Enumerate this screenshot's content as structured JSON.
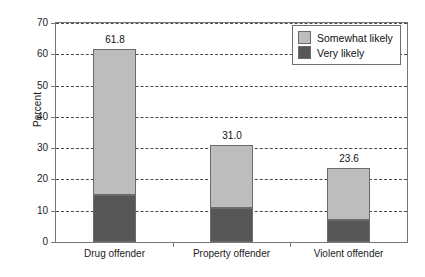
{
  "chart_data": {
    "type": "bar",
    "subtype": "stacked",
    "title": "",
    "xlabel": "",
    "ylabel": "Percent",
    "ylim": [
      0,
      70
    ],
    "yticks": [
      0,
      10,
      20,
      30,
      40,
      50,
      60,
      70
    ],
    "ytick_labels": [
      "0",
      "10",
      "20",
      "30",
      "40",
      "50",
      "60",
      "70"
    ],
    "grid": true,
    "grid_style": "dashed-horizontal",
    "legend_position": "top-right",
    "categories": [
      "Drug offender",
      "Property offender",
      "Violent offender"
    ],
    "series": [
      {
        "name": "Very likely",
        "color": "#575757",
        "values": [
          15.0,
          10.8,
          7.0
        ]
      },
      {
        "name": "Somewhat likely",
        "color": "#bdbdbd",
        "values": [
          46.8,
          20.2,
          16.6
        ]
      }
    ],
    "totals": [
      61.8,
      31.0,
      23.6
    ],
    "total_labels": [
      "61.8",
      "31.0",
      "23.6"
    ]
  },
  "legend": {
    "items": [
      {
        "label": "Somewhat likely",
        "color": "#bdbdbd"
      },
      {
        "label": "Very likely",
        "color": "#575757"
      }
    ]
  },
  "axes": {
    "y_title": "Percent"
  }
}
